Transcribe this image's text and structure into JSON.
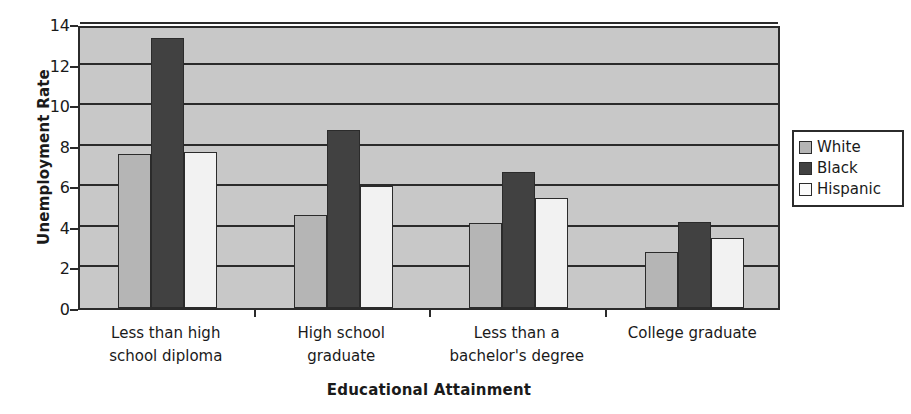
{
  "chart_data": {
    "type": "bar",
    "title": "",
    "xlabel": "Educational Attainment",
    "ylabel": "Unemployment Rate",
    "ylim": [
      0,
      14
    ],
    "yticks": [
      0,
      2,
      4,
      6,
      8,
      10,
      12,
      14
    ],
    "grid": true,
    "legend_position": "right",
    "categories": [
      "Less than high school diploma",
      "High school graduate",
      "Less than a bachelor's degree",
      "College graduate"
    ],
    "category_lines": [
      [
        "Less than high",
        "school diploma"
      ],
      [
        "High school",
        "graduate"
      ],
      [
        "Less than a",
        "bachelor's degree"
      ],
      [
        "College graduate",
        ""
      ]
    ],
    "series": [
      {
        "name": "White",
        "color": "#b5b5b5",
        "values": [
          7.6,
          4.6,
          4.2,
          2.75
        ]
      },
      {
        "name": "Black",
        "color": "#414141",
        "values": [
          13.3,
          8.8,
          6.7,
          4.25
        ]
      },
      {
        "name": "Hispanic",
        "color": "#f2f2f2",
        "values": [
          7.7,
          6.0,
          5.4,
          3.45
        ]
      }
    ]
  },
  "axis": {
    "y_title": "Unemployment Rate",
    "x_title": "Educational Attainment",
    "y_tick_labels": [
      "14",
      "12",
      "10",
      "8",
      "6",
      "4",
      "2",
      "0"
    ]
  },
  "legend": {
    "items": [
      {
        "label": "White"
      },
      {
        "label": "Black"
      },
      {
        "label": "Hispanic"
      }
    ]
  }
}
